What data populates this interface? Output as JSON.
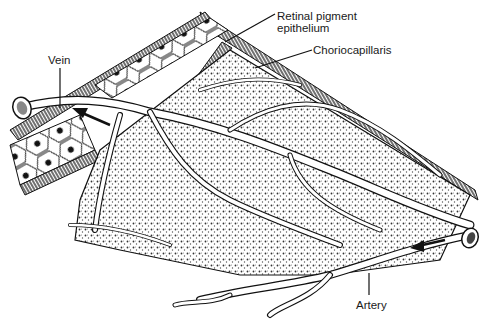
{
  "figure": {
    "labels": {
      "retinal_pigment_line1": "Retinal pigment",
      "retinal_pigment_line2": "epithelium",
      "choriocapillaris": "Choriocapillaris",
      "vein": "Vein",
      "artery": "Artery"
    },
    "colors": {
      "ink": "#1a1a1a",
      "background": "#ffffff",
      "stipple": "#444444"
    }
  }
}
